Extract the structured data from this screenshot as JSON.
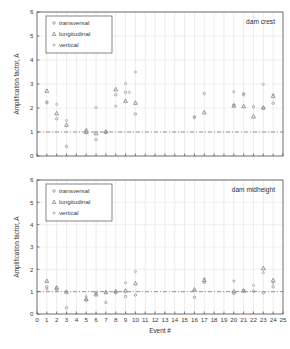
{
  "figure": {
    "title": "",
    "panels": [
      "dam crest",
      "dam midheight"
    ]
  },
  "chart_data": [
    {
      "type": "scatter",
      "title": "dam crest",
      "xlabel": "",
      "ylabel": "Amplification factor, A",
      "xlim": [
        0,
        25
      ],
      "ylim": [
        0,
        6
      ],
      "xticks": [
        0,
        1,
        2,
        3,
        4,
        5,
        6,
        7,
        8,
        9,
        10,
        11,
        12,
        13,
        14,
        15,
        16,
        17,
        18,
        19,
        20,
        21,
        22,
        23,
        24,
        25
      ],
      "yticks": [
        0,
        1,
        2,
        3,
        4,
        5,
        6
      ],
      "grid": true,
      "reference_line": {
        "y": 1.0,
        "style": "dash-dot"
      },
      "legend_position": "upper-left",
      "series": [
        {
          "name": "transversal",
          "marker": "dot",
          "points": [
            {
              "x": 1,
              "y": 2.25
            },
            {
              "x": 2,
              "y": 1.55
            },
            {
              "x": 3,
              "y": 0.4
            },
            {
              "x": 5,
              "y": 1.05
            },
            {
              "x": 6,
              "y": 0.68
            },
            {
              "x": 7,
              "y": 1.0
            },
            {
              "x": 8,
              "y": 2.55
            },
            {
              "x": 9,
              "y": 2.65
            },
            {
              "x": 10,
              "y": 1.75
            },
            {
              "x": 16,
              "y": 1.6
            },
            {
              "x": 17,
              "y": 2.6
            },
            {
              "x": 20,
              "y": 2.12
            },
            {
              "x": 21,
              "y": 2.55
            },
            {
              "x": 22,
              "y": 2.05
            },
            {
              "x": 23,
              "y": 2.0
            },
            {
              "x": 24,
              "y": 2.2
            }
          ]
        },
        {
          "name": "longitudinal",
          "marker": "triangle",
          "points": [
            {
              "x": 1,
              "y": 2.72
            },
            {
              "x": 2,
              "y": 1.78
            },
            {
              "x": 3,
              "y": 1.3
            },
            {
              "x": 5,
              "y": 1.0
            },
            {
              "x": 6,
              "y": 0.95
            },
            {
              "x": 7,
              "y": 1.02
            },
            {
              "x": 8,
              "y": 2.78
            },
            {
              "x": 9,
              "y": 2.3
            },
            {
              "x": 10,
              "y": 2.22
            },
            {
              "x": 17,
              "y": 1.82
            },
            {
              "x": 20,
              "y": 2.1
            },
            {
              "x": 21,
              "y": 2.08
            },
            {
              "x": 22,
              "y": 1.65
            },
            {
              "x": 23,
              "y": 2.02
            },
            {
              "x": 24,
              "y": 2.5
            }
          ]
        },
        {
          "name": "vertical",
          "marker": "dot-light",
          "points": [
            {
              "x": 1,
              "y": 2.2
            },
            {
              "x": 2,
              "y": 2.15
            },
            {
              "x": 3,
              "y": 1.48
            },
            {
              "x": 5,
              "y": 1.1
            },
            {
              "x": 6,
              "y": 2.02
            },
            {
              "x": 7,
              "y": 0.98
            },
            {
              "x": 8,
              "y": 2.08
            },
            {
              "x": 9,
              "y": 3.02
            },
            {
              "x": 9.4,
              "y": 2.65
            },
            {
              "x": 10,
              "y": 3.5
            },
            {
              "x": 16,
              "y": 1.65
            },
            {
              "x": 20,
              "y": 2.68
            },
            {
              "x": 21,
              "y": 2.6
            },
            {
              "x": 23,
              "y": 2.98
            },
            {
              "x": 24,
              "y": 2.55
            }
          ]
        }
      ]
    },
    {
      "type": "scatter",
      "title": "dam midheight",
      "xlabel": "Event #",
      "ylabel": "Amplification factor, A",
      "xlim": [
        0,
        25
      ],
      "ylim": [
        0,
        6
      ],
      "xticks": [
        0,
        1,
        2,
        3,
        4,
        5,
        6,
        7,
        8,
        9,
        10,
        11,
        12,
        13,
        14,
        15,
        16,
        17,
        18,
        19,
        20,
        21,
        22,
        23,
        24,
        25
      ],
      "yticks": [
        0,
        1,
        2,
        3,
        4,
        5,
        6
      ],
      "grid": true,
      "reference_line": {
        "y": 1.0,
        "style": "dash-dot"
      },
      "legend_position": "upper-left",
      "series": [
        {
          "name": "transversal",
          "marker": "dot",
          "points": [
            {
              "x": 1,
              "y": 1.22
            },
            {
              "x": 2,
              "y": 1.1
            },
            {
              "x": 3,
              "y": 0.28
            },
            {
              "x": 5,
              "y": 0.62
            },
            {
              "x": 6,
              "y": 0.92
            },
            {
              "x": 7,
              "y": 0.52
            },
            {
              "x": 8,
              "y": 0.95
            },
            {
              "x": 9,
              "y": 0.78
            },
            {
              "x": 10,
              "y": 0.85
            },
            {
              "x": 16,
              "y": 0.75
            },
            {
              "x": 17,
              "y": 1.42
            },
            {
              "x": 20,
              "y": 0.92
            },
            {
              "x": 21,
              "y": 1.05
            },
            {
              "x": 22,
              "y": 1.02
            },
            {
              "x": 23,
              "y": 0.95
            },
            {
              "x": 24,
              "y": 1.22
            }
          ]
        },
        {
          "name": "longitudinal",
          "marker": "triangle",
          "points": [
            {
              "x": 1,
              "y": 1.48
            },
            {
              "x": 2,
              "y": 1.18
            },
            {
              "x": 3,
              "y": 1.0
            },
            {
              "x": 5,
              "y": 0.68
            },
            {
              "x": 6,
              "y": 0.88
            },
            {
              "x": 7,
              "y": 0.98
            },
            {
              "x": 8,
              "y": 1.02
            },
            {
              "x": 9,
              "y": 1.05
            },
            {
              "x": 10,
              "y": 1.38
            },
            {
              "x": 16,
              "y": 1.1
            },
            {
              "x": 17,
              "y": 1.52
            },
            {
              "x": 20,
              "y": 1.02
            },
            {
              "x": 21,
              "y": 1.05
            },
            {
              "x": 23,
              "y": 2.05
            },
            {
              "x": 24,
              "y": 1.52
            }
          ]
        },
        {
          "name": "vertical",
          "marker": "dot-light",
          "points": [
            {
              "x": 1,
              "y": 1.12
            },
            {
              "x": 2,
              "y": 1.2
            },
            {
              "x": 3,
              "y": 0.98
            },
            {
              "x": 5,
              "y": 0.78
            },
            {
              "x": 6,
              "y": 0.98
            },
            {
              "x": 7,
              "y": 0.98
            },
            {
              "x": 8,
              "y": 1.0
            },
            {
              "x": 9,
              "y": 1.4
            },
            {
              "x": 10,
              "y": 1.9
            },
            {
              "x": 16,
              "y": 1.05
            },
            {
              "x": 17,
              "y": 1.58
            },
            {
              "x": 20,
              "y": 1.48
            },
            {
              "x": 21,
              "y": 1.02
            },
            {
              "x": 22,
              "y": 1.28
            },
            {
              "x": 23,
              "y": 1.85
            },
            {
              "x": 24,
              "y": 1.38
            }
          ]
        }
      ]
    }
  ],
  "colors": {
    "transversal": "#8f8f96",
    "longitudinal": "#7c7c86",
    "vertical": "#9b9ba2",
    "axis": "#4a4a4a",
    "grid": "#cfcfcf",
    "reference": "#6a6a6a",
    "text": "#3a3a3a"
  }
}
